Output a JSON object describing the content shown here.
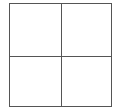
{
  "grid": {
    "rows": 2,
    "columns": 2,
    "line_color": "#555555",
    "background": "#ffffff",
    "cells": [
      {
        "row": 0,
        "col": 0,
        "content": ""
      },
      {
        "row": 0,
        "col": 1,
        "content": ""
      },
      {
        "row": 1,
        "col": 0,
        "content": ""
      },
      {
        "row": 1,
        "col": 1,
        "content": ""
      }
    ]
  }
}
